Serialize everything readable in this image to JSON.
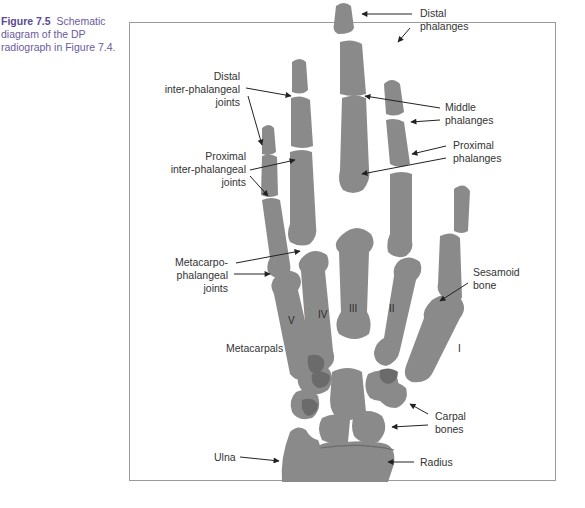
{
  "caption": {
    "figure_number": "Figure 7.5",
    "text": "Schematic diagram of the DP radiograph in Figure 7.4."
  },
  "diagram": {
    "colors": {
      "bone": "#8a8a8a",
      "overlap": "#6b6b6b",
      "frame": "#9a9a9a",
      "caption_accent": "#5a4a94"
    },
    "labels": {
      "distal_phalanges": [
        "Distal",
        "phalanges"
      ],
      "distal_ip_joints": [
        "Distal",
        "inter-phalangeal",
        "joints"
      ],
      "middle_phalanges": [
        "Middle",
        "phalanges"
      ],
      "proximal_phalanges": [
        "Proximal",
        "phalanges"
      ],
      "proximal_ip_joints": [
        "Proximal",
        "inter-phalangeal",
        "joints"
      ],
      "mcp_joints": [
        "Metacarpo-",
        "phalangeal",
        "joints"
      ],
      "sesamoid_bone": [
        "Sesamoid",
        "bone"
      ],
      "metacarpals": "Metacarpals",
      "carpal_bones": [
        "Carpal",
        "bones"
      ],
      "ulna": "Ulna",
      "radius": "Radius"
    },
    "metacarpal_numerals": [
      "I",
      "II",
      "III",
      "IV",
      "V"
    ]
  }
}
